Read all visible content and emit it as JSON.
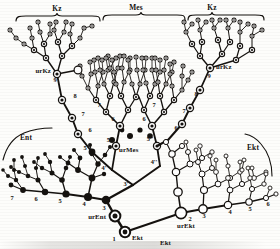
{
  "figure": {
    "type": "tree-diagram",
    "background_color": "#fdfdfb",
    "ink_color": "#15120f"
  },
  "group_labels": [
    {
      "id": "kz-left",
      "text": "Kz",
      "x": 57,
      "y": 11
    },
    {
      "id": "mes-top",
      "text": "Mes",
      "x": 128,
      "y": 10
    },
    {
      "id": "kz-right",
      "text": "Kz",
      "x": 211,
      "y": 10
    },
    {
      "id": "ent-left",
      "text": "Ent",
      "x": 20,
      "y": 139
    },
    {
      "id": "ekt-right",
      "text": "Ekt",
      "x": 247,
      "y": 150
    }
  ],
  "root_labels": [
    {
      "id": "urkz-left",
      "text": "urKz",
      "x": 37,
      "y": 72
    },
    {
      "id": "urkz-right",
      "text": "urKz",
      "x": 207,
      "y": 69
    },
    {
      "id": "urmes",
      "text": "urMes",
      "x": 116,
      "y": 151
    },
    {
      "id": "urent",
      "text": "urEnt",
      "x": 80,
      "y": 219
    },
    {
      "id": "urekt",
      "text": "urEkt",
      "x": 186,
      "y": 228
    },
    {
      "id": "ekt-bottom",
      "text": "Ekt",
      "x": 136,
      "y": 240
    },
    {
      "id": "ekt-lower-left",
      "text": "Ekt",
      "x": 165,
      "y": 243
    }
  ],
  "node_numbers": [
    {
      "text": "9",
      "x": 55,
      "y": 79
    },
    {
      "text": "8",
      "x": 76,
      "y": 95
    },
    {
      "text": "7",
      "x": 92,
      "y": 111
    },
    {
      "text": "6",
      "x": 108,
      "y": 127
    },
    {
      "text": "9",
      "x": 215,
      "y": 76
    },
    {
      "text": "8",
      "x": 196,
      "y": 93
    },
    {
      "text": "7",
      "x": 178,
      "y": 110
    },
    {
      "text": "6",
      "x": 160,
      "y": 126
    },
    {
      "text": "7",
      "x": 102,
      "y": 92
    },
    {
      "text": "6",
      "x": 112,
      "y": 110
    },
    {
      "text": "7",
      "x": 152,
      "y": 92
    },
    {
      "text": "6",
      "x": 142,
      "y": 110
    },
    {
      "text": "5'",
      "x": 84,
      "y": 150
    },
    {
      "text": "5''",
      "x": 148,
      "y": 143
    },
    {
      "text": "5''",
      "x": 108,
      "y": 144
    },
    {
      "text": "4'",
      "x": 104,
      "y": 170
    },
    {
      "text": "4''",
      "x": 153,
      "y": 167
    },
    {
      "text": "3'",
      "x": 126,
      "y": 188
    },
    {
      "text": "7",
      "x": 17,
      "y": 202
    },
    {
      "text": "6",
      "x": 40,
      "y": 202
    },
    {
      "text": "5",
      "x": 62,
      "y": 200
    },
    {
      "text": "4",
      "x": 85,
      "y": 201
    },
    {
      "text": "3",
      "x": 106,
      "y": 207
    },
    {
      "text": "1",
      "x": 115,
      "y": 241
    },
    {
      "text": "2",
      "x": 190,
      "y": 221
    },
    {
      "text": "3",
      "x": 207,
      "y": 219
    },
    {
      "text": "4",
      "x": 232,
      "y": 214
    },
    {
      "text": "5",
      "x": 252,
      "y": 211
    },
    {
      "text": "6",
      "x": 268,
      "y": 206
    }
  ],
  "brackets": [
    {
      "id": "bracket-kz-left",
      "x1": 16,
      "x2": 100,
      "y": 16
    },
    {
      "id": "bracket-mes",
      "x1": 103,
      "x2": 185,
      "y": 14
    },
    {
      "id": "bracket-kz-right",
      "x1": 188,
      "x2": 264,
      "y": 14
    },
    {
      "id": "bracket-ent",
      "x1": 3,
      "x2": 52,
      "y": 132
    },
    {
      "id": "bracket-ekt",
      "x1": 243,
      "x2": 272,
      "y": 140
    }
  ],
  "legend_note": {
    "ent_style": "filled black discs",
    "mes_style": "concentric double ring discs",
    "ekt_style": "open white circles"
  }
}
